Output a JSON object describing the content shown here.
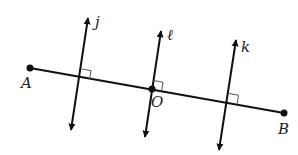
{
  "diagram": {
    "type": "geometry-perpendicular-lines",
    "segment": {
      "label": "AB",
      "endpoints": [
        "A",
        "B"
      ]
    },
    "points": {
      "A": {
        "label": "A",
        "x": 30,
        "y": 68
      },
      "B": {
        "label": "B",
        "x": 284,
        "y": 113
      },
      "O": {
        "label": "O",
        "x": 152,
        "y": 89
      }
    },
    "lines": {
      "j": {
        "label": "j",
        "x1": 88,
        "y1": 18,
        "x2": 71,
        "y2": 130,
        "perpendicular_to": "AB"
      },
      "l": {
        "label": "ℓ",
        "x1": 161,
        "y1": 31,
        "x2": 145,
        "y2": 137,
        "perpendicular_to": "AB",
        "through": "O"
      },
      "k": {
        "label": "k",
        "x1": 236,
        "y1": 40,
        "x2": 219,
        "y2": 150,
        "perpendicular_to": "AB"
      }
    },
    "colors": {
      "stroke": "#111111",
      "right_angle": "#555555",
      "label": "#222222"
    }
  }
}
